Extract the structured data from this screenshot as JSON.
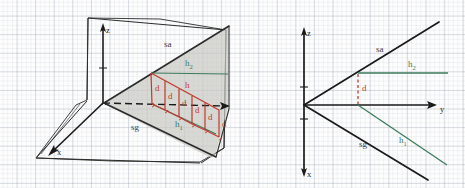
{
  "figure": {
    "background": "graph-paper",
    "panels": [
      {
        "id": "left-panel",
        "name": "3d-perspective-view",
        "projection": "3d-oblique",
        "axes": [
          {
            "name": "z",
            "label": "z",
            "direction": "up"
          },
          {
            "name": "x",
            "label": "x",
            "direction": "down-left"
          },
          {
            "name": "y",
            "label": "y",
            "direction": "right",
            "style": "dashed"
          }
        ],
        "labels": {
          "sa": "sa",
          "sg": "sg",
          "h": "h",
          "h1": "h",
          "h1_sub": "1",
          "h2": "h",
          "h2_sub": "2",
          "d": "d"
        },
        "step_count": 5,
        "d_labels": [
          "d",
          "d",
          "d",
          "d",
          "d",
          "d"
        ],
        "surface_fill": "#c9c9c4"
      },
      {
        "id": "right-panel",
        "name": "2d-side-view",
        "projection": "2d-yz",
        "axes": [
          {
            "name": "z",
            "label": "z",
            "direction": "up"
          },
          {
            "name": "x",
            "label": "x",
            "direction": "down"
          },
          {
            "name": "y",
            "label": "y",
            "direction": "right"
          }
        ],
        "labels": {
          "sa": "sa",
          "sg": "sg",
          "h1": "h",
          "h1_sub": "1",
          "h2": "h",
          "h2_sub": "2",
          "d": "d"
        }
      }
    ],
    "colors": {
      "ink": "#2b2b2b",
      "red": "#c0392b",
      "green": "#3d7a5c",
      "grid": "#96a0af",
      "fill": "#c9c9c4"
    }
  }
}
